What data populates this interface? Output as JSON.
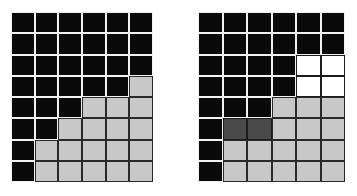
{
  "figure": {
    "title": "",
    "background_color": "#ffffff",
    "panel_count": 2
  },
  "legend": {
    "black_label": "black",
    "light_gray_label": "light gray",
    "dark_gray_label": "dark gray",
    "white_label": "white"
  },
  "colors": {
    "black": "#0a0a0a",
    "light_gray": "#c8c8c8",
    "dark_gray": "#4a4a4a",
    "white": "#ffffff",
    "grid_line_light": "#f2f2f2",
    "grid_line_dark": "#2a2a2a"
  },
  "chart_data": {
    "type": "heatmap",
    "title": "",
    "subtitle": "",
    "xlabel": "",
    "ylabel": "",
    "grid": true,
    "legend_position": "none",
    "rows": 8,
    "columns": 6,
    "value_colors": {
      "black": "#0a0a0a",
      "lgray": "#c8c8c8",
      "dgray": "#4a4a4a",
      "white": "#ffffff"
    },
    "panels": [
      {
        "name": "left-grid",
        "rows": 8,
        "columns": 6,
        "cells": [
          [
            "black",
            "black",
            "black",
            "black",
            "black",
            "black"
          ],
          [
            "black",
            "black",
            "black",
            "black",
            "black",
            "black"
          ],
          [
            "black",
            "black",
            "black",
            "black",
            "black",
            "black"
          ],
          [
            "black",
            "black",
            "black",
            "black",
            "black",
            "lgray"
          ],
          [
            "black",
            "black",
            "black",
            "lgray",
            "lgray",
            "lgray"
          ],
          [
            "black",
            "black",
            "lgray",
            "lgray",
            "lgray",
            "lgray"
          ],
          [
            "black",
            "lgray",
            "lgray",
            "lgray",
            "lgray",
            "lgray"
          ],
          [
            "black",
            "lgray",
            "lgray",
            "lgray",
            "lgray",
            "lgray"
          ]
        ]
      },
      {
        "name": "right-grid",
        "rows": 8,
        "columns": 6,
        "cells": [
          [
            "black",
            "black",
            "black",
            "black",
            "black",
            "black"
          ],
          [
            "black",
            "black",
            "black",
            "black",
            "black",
            "black"
          ],
          [
            "black",
            "black",
            "black",
            "black",
            "white",
            "white"
          ],
          [
            "black",
            "black",
            "black",
            "black",
            "white",
            "white"
          ],
          [
            "black",
            "black",
            "black",
            "lgray",
            "lgray",
            "lgray"
          ],
          [
            "black",
            "dgray",
            "dgray",
            "lgray",
            "lgray",
            "lgray"
          ],
          [
            "black",
            "lgray",
            "lgray",
            "lgray",
            "lgray",
            "lgray"
          ],
          [
            "black",
            "lgray",
            "lgray",
            "lgray",
            "lgray",
            "lgray"
          ]
        ]
      }
    ]
  }
}
